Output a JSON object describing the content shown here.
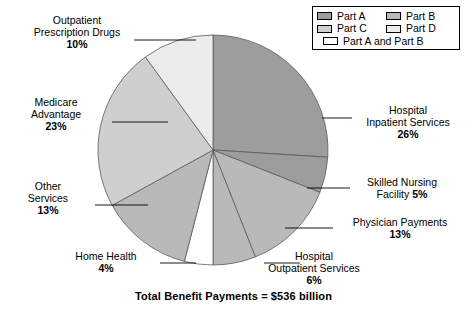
{
  "caption": "Total Benefit Payments = $536 billion",
  "legend": {
    "rows": [
      [
        {
          "label": "Part A",
          "color": "#9d9d9d",
          "name": "legend-item-part-a"
        },
        {
          "label": "Part B",
          "color": "#b9b9b9",
          "name": "legend-item-part-b"
        }
      ],
      [
        {
          "label": "Part C",
          "color": "#cfcfcf",
          "name": "legend-item-part-c"
        },
        {
          "label": "Part D",
          "color": "#ececec",
          "name": "legend-item-part-d"
        }
      ],
      [
        {
          "label": "Part A and Part B",
          "color": "#ffffff",
          "name": "legend-item-part-a-and-part-b"
        }
      ]
    ]
  },
  "chart_data": {
    "type": "pie",
    "title": "Total Benefit Payments = $536 billion",
    "total_label": "$536 billion",
    "start_angle_deg": 0,
    "direction": "clockwise",
    "legend_position": "top-right",
    "categories": [
      "Hospital Inpatient Services",
      "Skilled Nursing Facility",
      "Physician Payments",
      "Hospital Outpatient Services",
      "Home Health",
      "Other Services",
      "Medicare Advantage",
      "Outpatient Prescription Drugs"
    ],
    "values": [
      26,
      5,
      13,
      6,
      4,
      13,
      23,
      10
    ],
    "units": "percent",
    "slices": [
      {
        "name": "Hospital Inpatient Services",
        "value": 26,
        "pct_label": "26%",
        "color": "#9d9d9d",
        "part": "Part A"
      },
      {
        "name": "Skilled Nursing Facility",
        "value": 5,
        "pct_label": "5%",
        "color": "#9d9d9d",
        "part": "Part A"
      },
      {
        "name": "Physician Payments",
        "value": 13,
        "pct_label": "13%",
        "color": "#b9b9b9",
        "part": "Part B"
      },
      {
        "name": "Hospital Outpatient Services",
        "value": 6,
        "pct_label": "6%",
        "color": "#b9b9b9",
        "part": "Part B"
      },
      {
        "name": "Home Health",
        "value": 4,
        "pct_label": "4%",
        "color": "#ffffff",
        "part": "Part A and Part B"
      },
      {
        "name": "Other Services",
        "value": 13,
        "pct_label": "13%",
        "color": "#b9b9b9",
        "part": "Part B"
      },
      {
        "name": "Medicare Advantage",
        "value": 23,
        "pct_label": "23%",
        "color": "#cfcfcf",
        "part": "Part C"
      },
      {
        "name": "Outpatient Prescription Drugs",
        "value": 10,
        "pct_label": "10%",
        "color": "#ececec",
        "part": "Part D"
      }
    ]
  },
  "labels": {
    "outpatient_rx": {
      "l1": "Outpatient",
      "l2": "Prescription Drugs",
      "pct": "10%"
    },
    "medicare_adv": {
      "l1": "Medicare",
      "l2": "Advantage",
      "pct": "23%"
    },
    "other_services": {
      "l1": "Other",
      "l2": "Services",
      "pct": "13%"
    },
    "home_health": {
      "l1": "Home Health",
      "pct": "4%"
    },
    "hosp_outpatient": {
      "l1": "Hospital",
      "l2": "Outpatient Services",
      "pct": "6%"
    },
    "physician": {
      "l1": "Physician Payments",
      "pct": "13%"
    },
    "snf": {
      "l1": "Skilled Nursing",
      "l2": "Facility",
      "pct": "5%"
    },
    "hosp_inpatient": {
      "l1": "Hospital",
      "l2": "Inpatient Services",
      "pct": "26%"
    }
  }
}
